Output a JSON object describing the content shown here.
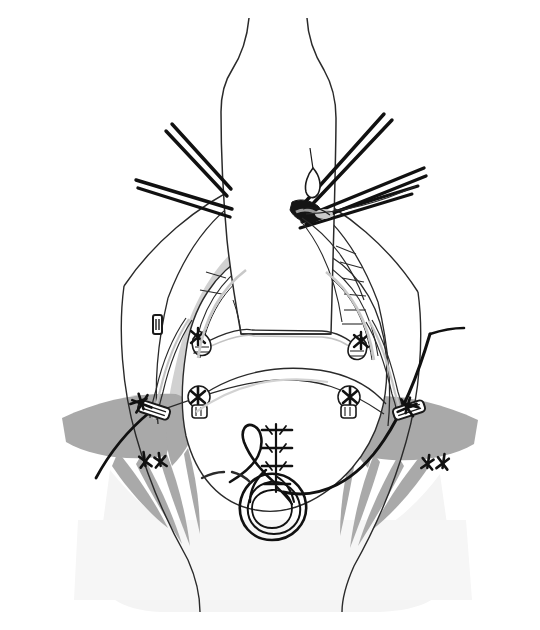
{
  "figure": {
    "title": "Operative field: median sternotomy with aortic cannulation and pericardial retraction",
    "domain": "medical-surgical-line-illustration",
    "canvas": {
      "width": 540,
      "height": 630
    },
    "background_color": "#ffffff",
    "style": {
      "line_color": "#1a1a1a",
      "thin_line_color": "#3a3a3a",
      "mid_gray": "#9e9e9e",
      "dark_gray": "#a8a8a8",
      "light_gray": "#d6d6d6",
      "very_light_gray": "#f0f0f0",
      "fill_white": "#ffffff",
      "stroke_width_thin": 1.1,
      "stroke_width_normal": 1.6,
      "stroke_width_heavy": 3.6
    }
  },
  "anatomy": {
    "central_conduit": {
      "name": "aortic-graft-conduit",
      "description": "Vertical tubular conduit (aortic graft / cannula sheath) descending from top of field, widening at shoulder, ending in a flat distal cuff",
      "outline_points": "248,18 244,38 238,58 228,78 224,96 222,140 224,200 228,250 234,290 238,310 244,330 330,334 330,300 332,260 334,210 336,160 336,120 332,100 324,80 314,58 308,36 306,18",
      "shoulder_left_y": 96,
      "shoulder_right_y": 100,
      "distal_cuff_y": 334,
      "fill": "#ffffff"
    },
    "pericardial_well": {
      "name": "pericardial-cavity",
      "description": "Large rounded cavity of the pericardium seen through the sternotomy, bounded by retracted pericardial edges",
      "fill": "#ffffff"
    },
    "pericardial_edges": [
      {
        "side": "left",
        "label": "left-pericardial-retraction-edge"
      },
      {
        "side": "right",
        "label": "right-pericardial-retraction-edge"
      }
    ],
    "chest_wall_flaps": [
      {
        "side": "left",
        "label": "left-sternal-retracted-flap",
        "shade": "#d6d6d6"
      },
      {
        "side": "right",
        "label": "right-sternal-retracted-flap",
        "shade": "#d6d6d6"
      }
    ],
    "shadow_fans": [
      {
        "side": "left",
        "label": "left-shadow-fan",
        "shade": "#a8a8a8",
        "spike_count": 4
      },
      {
        "side": "right",
        "label": "right-shadow-fan",
        "shade": "#a8a8a8",
        "spike_count": 4
      }
    ],
    "lower_field_wash": {
      "label": "lower-field-wash",
      "shade": "#f3f3f3"
    }
  },
  "instruments": {
    "left_upper_instrument": {
      "name": "left-upper-forceps-shaft",
      "description": "Paired straight instrument shafts entering from upper left toward the aorta",
      "tip_x": 228,
      "tip_y": 186,
      "tail_x": 172,
      "tail_y": 124
    },
    "left_lower_instrument": {
      "name": "left-lower-forceps-shaft",
      "description": "Paired straight instrument shafts entering from the left toward the aortic root",
      "tip_x": 226,
      "tip_y": 212,
      "tail_x": 136,
      "tail_y": 180
    },
    "right_upper_instrument": {
      "name": "right-upper-needle-driver-shaft",
      "description": "Paired straight shafts entering from upper right, converging on the aortic purse-string site",
      "tip_x": 306,
      "tip_y": 212,
      "tail_x": 390,
      "tail_y": 122
    },
    "right_mid_instrument": {
      "name": "right-mid-forceps-shaft",
      "description": "Paired straight shafts entering from the right, crossing beneath the upper pair",
      "tip_x": 304,
      "tip_y": 218,
      "tail_x": 424,
      "tail_y": 170
    },
    "right_lower_instrument": {
      "name": "right-lower-forceps-shaft",
      "description": "Paired straight shafts entering low from the right toward the same site",
      "tip_x": 302,
      "tip_y": 224,
      "tail_x": 420,
      "tail_y": 188
    },
    "aortic_cannulation_site": {
      "name": "aortic-cannulation-site",
      "description": "Dark ink-filled entry point on the right wall of the aorta where instruments converge",
      "x": 302,
      "y": 215
    },
    "small_needle_loop": {
      "name": "suture-needle-loop",
      "description": "Curved needle with thread loop above the cannulation site",
      "x": 314,
      "y": 178
    }
  },
  "sutures": {
    "pledgeted_knots": [
      {
        "id": "knot-left-upper",
        "label": "pledgeted-suture-left-upper",
        "x": 201,
        "y": 341
      },
      {
        "id": "knot-right-upper",
        "label": "pledgeted-suture-right-upper",
        "x": 358,
        "y": 345
      },
      {
        "id": "knot-left-mid",
        "label": "pledgeted-suture-left-mid",
        "x": 199,
        "y": 399
      },
      {
        "id": "knot-right-mid",
        "label": "pledgeted-suture-right-mid",
        "x": 349,
        "y": 399
      }
    ],
    "stay_stitches": [
      {
        "id": "stitch-left-pericardium",
        "label": "pericardial-stay-stitch-left",
        "x": 145,
        "y": 404,
        "rotation": -18
      },
      {
        "id": "stitch-right-pericardium",
        "label": "pericardial-stay-stitch-right",
        "x": 405,
        "y": 408,
        "rotation": 16
      },
      {
        "id": "stitch-left-chest",
        "label": "chest-wall-stay-stitch-left",
        "x": 156,
        "y": 464,
        "rotation": -10
      },
      {
        "id": "stitch-right-chest",
        "label": "chest-wall-stay-stitch-right",
        "x": 437,
        "y": 466,
        "rotation": 10
      }
    ],
    "pledgets": [
      {
        "id": "pledget-left",
        "label": "felt-pledget-left",
        "x": 154,
        "y": 410,
        "rotation": -72
      },
      {
        "id": "pledget-right",
        "label": "felt-pledget-right",
        "x": 410,
        "y": 410,
        "rotation": 74
      }
    ],
    "running_closure": {
      "name": "running-closure-stitch-row",
      "description": "Short row of horizontal mattress stitches closing a midline incision",
      "x": 276,
      "y": 448,
      "rung_count": 4
    },
    "purse_string_coil": {
      "name": "purse-string-tourniquet-coil",
      "description": "Coiled suture loop (Rumel tourniquet / purse-string) at the lower midline",
      "cx": 275,
      "cy": 500,
      "r_outer": 34,
      "r_mid": 24,
      "r_inner": 13
    },
    "free_loop": {
      "name": "free-suture-loop",
      "description": "Loose hanging loop of suture to the left of the coil",
      "x": 244,
      "y": 455
    },
    "long_suture_tail": {
      "name": "long-suture-tail",
      "description": "Heavy suture strand sweeping from the lower midline up and out to the right margin",
      "from": "283,490",
      "to": "430,330"
    },
    "left_suture_tail": {
      "name": "left-suture-tail",
      "description": "Heavy suture strand sweeping from the left pledget down and out to the lower left",
      "from": "150,410",
      "to": "96,478"
    },
    "cross_field_strand": {
      "name": "cross-field-suture-strand",
      "description": "Fine strand arcing across the pericardial cavity connecting the mid pledgeted knots",
      "from": "199,399",
      "to": "349,399"
    }
  },
  "hardware": {
    "surgical_clip": {
      "name": "surgical-clip",
      "description": "Small rectangular metal clip on the left pericardial reflection",
      "x": 157,
      "y": 323,
      "w": 8,
      "h": 18
    },
    "drain_tubing": {
      "name": "drain-tubing",
      "description": "Double-line tubing running along the left pericardial edge down to the pledget",
      "path": "170,300 160,340 155,380 152,404"
    }
  },
  "detail_marks": {
    "rib_hatching_right": {
      "name": "pericardial-hatch-marks-right",
      "description": "Short oblique hatch marks along the inner right pericardial edge",
      "count": 6
    },
    "dashed_arc": {
      "name": "dashed-tissue-arc",
      "description": "Short dashed arc left of the purse-string coil indicating a tissue fold",
      "x": 216,
      "y": 476
    }
  },
  "labels": {
    "figure_caption": "",
    "annotations": []
  }
}
